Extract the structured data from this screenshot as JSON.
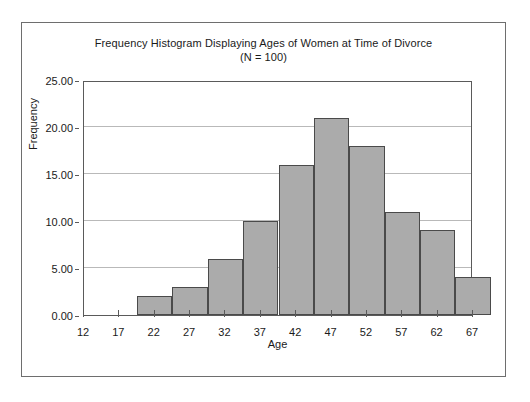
{
  "chart_data": {
    "type": "bar",
    "title": "Frequency Histogram Displaying Ages of Women at Time of Divorce",
    "subtitle": "(N = 100)",
    "xlabel": "Age",
    "ylabel": "Frequency",
    "xlim": [
      12,
      67
    ],
    "ylim": [
      0,
      25
    ],
    "x_ticks": [
      "12",
      "17",
      "22",
      "27",
      "32",
      "37",
      "42",
      "47",
      "52",
      "57",
      "62",
      "67"
    ],
    "x_tick_values": [
      12,
      17,
      22,
      27,
      32,
      37,
      42,
      47,
      52,
      57,
      62,
      67
    ],
    "y_ticks": [
      "0.00",
      "5.00",
      "10.00",
      "15.00",
      "20.00",
      "25.00"
    ],
    "y_tick_values": [
      0,
      5,
      10,
      15,
      20,
      25
    ],
    "grid": "horizontal",
    "legend": "none",
    "bin_width": 5,
    "bin_starts": [
      12,
      17,
      22,
      27,
      32,
      37,
      42,
      47,
      52,
      57,
      62
    ],
    "bin_offset": 2.5,
    "categories": [
      "12-17",
      "17-22",
      "22-27",
      "27-32",
      "32-37",
      "37-42",
      "42-47",
      "47-52",
      "52-57",
      "57-62",
      "62-67"
    ],
    "values": [
      0,
      2,
      3,
      6,
      10,
      16,
      21,
      18,
      11,
      9,
      4
    ],
    "bar_fill_color": "#ababab",
    "bar_edge_color": "#4a4a4a",
    "gridline_color": "#b9b9b9",
    "axis_color": "#5a5a5a",
    "frame_color": "#6e6e6e",
    "background_color": "#ffffff"
  }
}
